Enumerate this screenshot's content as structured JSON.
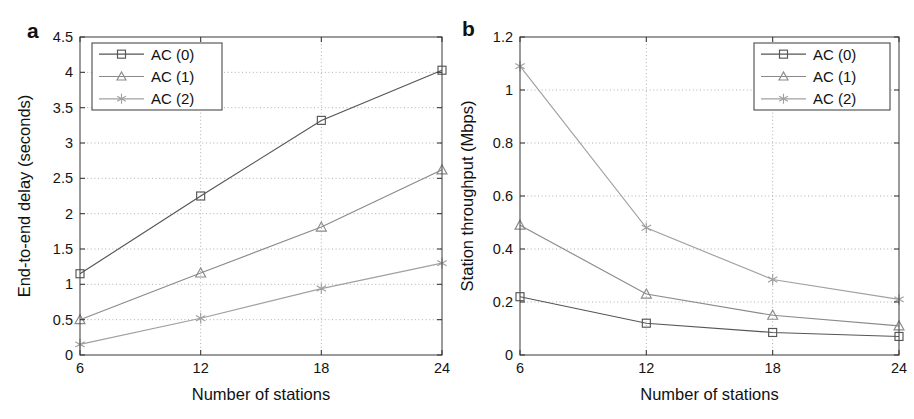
{
  "figure": {
    "panel_a_label": "a",
    "panel_b_label": "b",
    "background_color": "#ffffff",
    "axis_color": "#3a3a3a",
    "grid_color": "#9a9a9a"
  },
  "chart_data": [
    {
      "panel": "a",
      "type": "line",
      "title": "",
      "xlabel": "Number of stations",
      "ylabel": "End-to-end delay (seconds)",
      "x": [
        6,
        12,
        18,
        24
      ],
      "xticks": [
        "6",
        "12",
        "18",
        "24"
      ],
      "yticks": [
        "0",
        "0.5",
        "1",
        "1.5",
        "2",
        "2.5",
        "3",
        "3.5",
        "4",
        "4.5"
      ],
      "xlim": [
        6,
        24
      ],
      "ylim": [
        0,
        4.5
      ],
      "grid": true,
      "legend_position": "top-left",
      "series": [
        {
          "name": "AC (0)",
          "marker": "square",
          "color": "#555555",
          "values": [
            1.15,
            2.25,
            3.32,
            4.03
          ]
        },
        {
          "name": "AC (1)",
          "marker": "triangle",
          "color": "#8a8a8a",
          "values": [
            0.5,
            1.16,
            1.81,
            2.62
          ]
        },
        {
          "name": "AC (2)",
          "marker": "star",
          "color": "#a0a0a0",
          "values": [
            0.15,
            0.52,
            0.94,
            1.3
          ]
        }
      ]
    },
    {
      "panel": "b",
      "type": "line",
      "title": "",
      "xlabel": "Number of stations",
      "ylabel": "Station throughput (Mbps)",
      "x": [
        6,
        12,
        18,
        24
      ],
      "xticks": [
        "6",
        "12",
        "18",
        "24"
      ],
      "yticks": [
        "0",
        "0.2",
        "0.4",
        "0.6",
        "0.8",
        "1",
        "1.2"
      ],
      "xlim": [
        6,
        24
      ],
      "ylim": [
        0,
        1.2
      ],
      "grid": true,
      "legend_position": "top-right",
      "series": [
        {
          "name": "AC (0)",
          "marker": "square",
          "color": "#555555",
          "values": [
            0.22,
            0.12,
            0.085,
            0.07
          ]
        },
        {
          "name": "AC (1)",
          "marker": "triangle",
          "color": "#8a8a8a",
          "values": [
            0.49,
            0.23,
            0.15,
            0.11
          ]
        },
        {
          "name": "AC (2)",
          "marker": "star",
          "color": "#a0a0a0",
          "values": [
            1.09,
            0.48,
            0.285,
            0.21
          ]
        }
      ]
    }
  ]
}
